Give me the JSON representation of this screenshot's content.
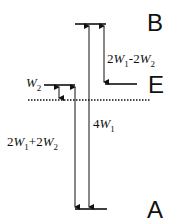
{
  "diagram": {
    "type": "energy-level-diagram",
    "levels": [
      {
        "id": "B",
        "label": "B"
      },
      {
        "id": "E",
        "label": "E"
      },
      {
        "id": "W2",
        "label_var": "W",
        "label_sub": "2"
      },
      {
        "id": "A",
        "label": "A"
      }
    ],
    "transitions": [
      {
        "from": "B",
        "to": "E",
        "label": "2W1-2W2",
        "parts": [
          "2",
          "W",
          "1",
          "-2",
          "W",
          "2"
        ]
      },
      {
        "from": "A",
        "to": "B",
        "label": "4W1",
        "parts": [
          "4",
          "W",
          "1"
        ]
      },
      {
        "from": "A",
        "to": "W2",
        "label": "2W1+2W2",
        "parts": [
          "2",
          "W",
          "1",
          "+2",
          "W",
          "2"
        ]
      },
      {
        "from": "reference",
        "to": "W2",
        "label": "W2"
      }
    ],
    "reference_line": "dotted"
  }
}
